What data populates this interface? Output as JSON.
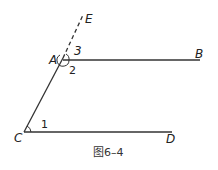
{
  "figure": {
    "caption": "图6–4",
    "points": {
      "A": "A",
      "B": "B",
      "C": "C",
      "D": "D",
      "E": "E"
    },
    "angles": {
      "angle1": "1",
      "angle2": "2",
      "angle3": "3"
    },
    "segments": [
      {
        "name": "AB",
        "style": "solid"
      },
      {
        "name": "CD",
        "style": "solid"
      },
      {
        "name": "CA",
        "style": "solid"
      },
      {
        "name": "AE",
        "style": "dashed"
      }
    ],
    "colors": {
      "stroke": "#333333",
      "background": "#ffffff"
    }
  }
}
